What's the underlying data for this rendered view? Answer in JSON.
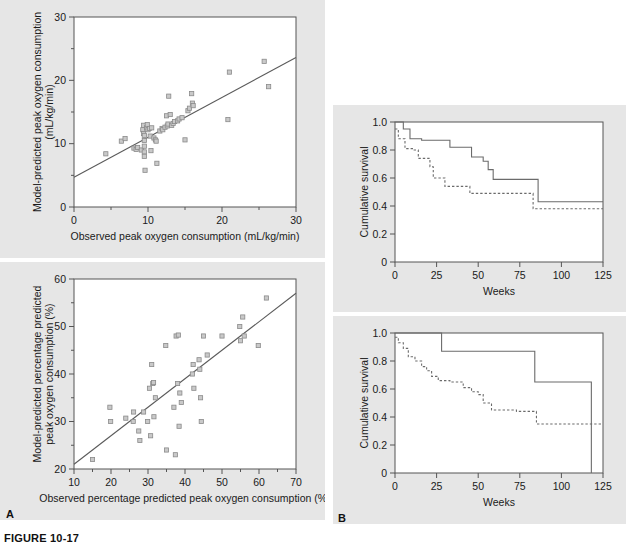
{
  "figure": {
    "caption": "FIGURE 10-17",
    "panel_a_label": "A",
    "panel_b_label": "B"
  },
  "chart_data": [
    {
      "id": "top-left",
      "type": "scatter",
      "title": "",
      "xlabel": "Observed peak oxygen consumption (mL/kg/min)",
      "ylabel": "Model-predicted peak oxygen consumption (mL/kg/min)",
      "ylabel_line1": "Model-predicted peak oxygen consumption",
      "ylabel_line2": "(mL/kg/min)",
      "xlim": [
        0,
        30
      ],
      "ylim": [
        0,
        30
      ],
      "xticks": [
        0,
        10,
        20,
        30
      ],
      "yticks": [
        0,
        10,
        20,
        30
      ],
      "xminor": [
        5,
        15,
        25
      ],
      "yminor": [
        5,
        15,
        25
      ],
      "grid": false,
      "legend": "none",
      "fit_line": {
        "x0": 0,
        "y0": 4.7,
        "x1": 30,
        "y1": 23.6
      },
      "points": [
        [
          4.3,
          8.4
        ],
        [
          6.4,
          10.4
        ],
        [
          6.9,
          10.8
        ],
        [
          8.1,
          9.3
        ],
        [
          8.4,
          9.1
        ],
        [
          8.6,
          9.4
        ],
        [
          9.1,
          9.0
        ],
        [
          9.3,
          12.2
        ],
        [
          9.4,
          12.9
        ],
        [
          9.4,
          11.6
        ],
        [
          9.5,
          11.3
        ],
        [
          9.5,
          10.5
        ],
        [
          9.5,
          9.6
        ],
        [
          9.5,
          8.7
        ],
        [
          9.5,
          8.0
        ],
        [
          9.6,
          5.8
        ],
        [
          9.8,
          12.5
        ],
        [
          9.9,
          13.0
        ],
        [
          10.0,
          12.2
        ],
        [
          10.2,
          12.4
        ],
        [
          10.3,
          11.2
        ],
        [
          10.4,
          8.9
        ],
        [
          10.5,
          12.5
        ],
        [
          10.8,
          10.9
        ],
        [
          11.0,
          10.6
        ],
        [
          11.1,
          10.4
        ],
        [
          11.2,
          6.9
        ],
        [
          11.6,
          12.0
        ],
        [
          11.9,
          12.4
        ],
        [
          12.0,
          12.2
        ],
        [
          12.3,
          12.6
        ],
        [
          12.5,
          14.4
        ],
        [
          12.6,
          12.8
        ],
        [
          12.7,
          13.1
        ],
        [
          12.8,
          17.5
        ],
        [
          13.0,
          14.6
        ],
        [
          13.2,
          12.9
        ],
        [
          13.4,
          13.2
        ],
        [
          13.6,
          13.5
        ],
        [
          14.0,
          13.6
        ],
        [
          14.2,
          13.9
        ],
        [
          14.6,
          14.1
        ],
        [
          15.0,
          10.6
        ],
        [
          15.4,
          15.2
        ],
        [
          15.6,
          15.6
        ],
        [
          15.9,
          17.9
        ],
        [
          16.0,
          16.4
        ],
        [
          16.1,
          16.0
        ],
        [
          20.8,
          13.8
        ],
        [
          21.0,
          21.3
        ],
        [
          25.7,
          23.0
        ],
        [
          26.3,
          19.0
        ]
      ]
    },
    {
      "id": "bottom-left",
      "type": "scatter",
      "title": "",
      "xlabel": "Observed percentage predicted peak oxygen consumption (%)",
      "ylabel": "Model-predicted percentage predicted peak oxygen consumption (%)",
      "ylabel_line1": "Model-predicted percentage predicted",
      "ylabel_line2": "peak oxygen consumption (%)",
      "xlim": [
        10,
        70
      ],
      "ylim": [
        20,
        60
      ],
      "xticks": [
        10,
        20,
        30,
        40,
        50,
        60,
        70
      ],
      "yticks": [
        20,
        30,
        40,
        50,
        60
      ],
      "xminor": [
        15,
        25,
        35,
        45,
        55,
        65
      ],
      "yminor": [
        25,
        35,
        45,
        55
      ],
      "grid": false,
      "legend": "none",
      "fit_line": {
        "x0": 10,
        "y0": 21.0,
        "x1": 70,
        "y1": 57.0
      },
      "points": [
        [
          15.0,
          22.0
        ],
        [
          19.7,
          33.0
        ],
        [
          19.9,
          30.0
        ],
        [
          24.0,
          30.7
        ],
        [
          26.0,
          30.0
        ],
        [
          26.1,
          32.0
        ],
        [
          27.5,
          28.0
        ],
        [
          27.8,
          26.0
        ],
        [
          28.8,
          32.0
        ],
        [
          29.9,
          30.0
        ],
        [
          30.4,
          37.0
        ],
        [
          30.7,
          27.0
        ],
        [
          31.0,
          42.0
        ],
        [
          31.3,
          38.0
        ],
        [
          31.5,
          38.2
        ],
        [
          31.6,
          31.0
        ],
        [
          32.0,
          35.0
        ],
        [
          34.8,
          46.0
        ],
        [
          35.0,
          24.0
        ],
        [
          37.0,
          33.0
        ],
        [
          37.4,
          23.0
        ],
        [
          37.6,
          48.0
        ],
        [
          38.0,
          38.0
        ],
        [
          38.2,
          48.2
        ],
        [
          38.4,
          29.0
        ],
        [
          38.6,
          36.0
        ],
        [
          39.0,
          34.0
        ],
        [
          42.0,
          40.0
        ],
        [
          42.2,
          42.0
        ],
        [
          42.4,
          37.0
        ],
        [
          43.8,
          43.0
        ],
        [
          44.0,
          41.0
        ],
        [
          44.2,
          35.0
        ],
        [
          44.4,
          30.0
        ],
        [
          45.0,
          48.0
        ],
        [
          46.0,
          44.0
        ],
        [
          50.0,
          48.0
        ],
        [
          54.8,
          50.0
        ],
        [
          55.0,
          47.0
        ],
        [
          55.6,
          52.0
        ],
        [
          56.0,
          48.0
        ],
        [
          59.8,
          46.0
        ],
        [
          62.0,
          56.0
        ]
      ]
    },
    {
      "id": "top-right",
      "type": "line",
      "subtype": "kaplan-meier",
      "title": "",
      "xlabel": "Weeks",
      "ylabel": "Cumulative survival",
      "xlim": [
        0,
        125
      ],
      "ylim": [
        0,
        1.0
      ],
      "xticks": [
        0,
        25,
        50,
        75,
        100,
        125
      ],
      "yticks": [
        0,
        0.2,
        0.4,
        0.6,
        0.8,
        1.0
      ],
      "ytick_labels": [
        "0",
        "0.2",
        "0.4",
        "0.6",
        "0.8",
        "1.0"
      ],
      "grid": false,
      "legend": "none",
      "series": [
        {
          "name": "solid",
          "style": "solid",
          "steps": [
            [
              0,
              1.0
            ],
            [
              5,
              1.0
            ],
            [
              5,
              0.95
            ],
            [
              9,
              0.95
            ],
            [
              9,
              0.88
            ],
            [
              16,
              0.88
            ],
            [
              16,
              0.87
            ],
            [
              33,
              0.87
            ],
            [
              33,
              0.82
            ],
            [
              46,
              0.82
            ],
            [
              46,
              0.75
            ],
            [
              53,
              0.75
            ],
            [
              53,
              0.72
            ],
            [
              56,
              0.72
            ],
            [
              56,
              0.66
            ],
            [
              59,
              0.66
            ],
            [
              59,
              0.59
            ],
            [
              86,
              0.59
            ],
            [
              86,
              0.43
            ],
            [
              125,
              0.43
            ]
          ]
        },
        {
          "name": "dashed",
          "style": "dashed",
          "steps": [
            [
              0,
              0.95
            ],
            [
              2,
              0.95
            ],
            [
              2,
              0.88
            ],
            [
              6,
              0.88
            ],
            [
              6,
              0.81
            ],
            [
              11,
              0.81
            ],
            [
              11,
              0.8
            ],
            [
              14,
              0.8
            ],
            [
              14,
              0.74
            ],
            [
              21,
              0.74
            ],
            [
              21,
              0.68
            ],
            [
              23,
              0.68
            ],
            [
              23,
              0.6
            ],
            [
              30,
              0.6
            ],
            [
              30,
              0.54
            ],
            [
              45,
              0.54
            ],
            [
              45,
              0.49
            ],
            [
              83,
              0.49
            ],
            [
              83,
              0.38
            ],
            [
              125,
              0.38
            ]
          ]
        }
      ]
    },
    {
      "id": "bottom-right",
      "type": "line",
      "subtype": "kaplan-meier",
      "title": "",
      "xlabel": "Weeks",
      "ylabel": "Cumulative survival",
      "xlim": [
        0,
        125
      ],
      "ylim": [
        0,
        1.0
      ],
      "xticks": [
        0,
        25,
        50,
        75,
        100,
        125
      ],
      "yticks": [
        0,
        0.2,
        0.4,
        0.6,
        0.8,
        1.0
      ],
      "ytick_labels": [
        "0",
        "0.2",
        "0.4",
        "0.6",
        "0.8",
        "1.0"
      ],
      "grid": false,
      "legend": "none",
      "series": [
        {
          "name": "solid",
          "style": "solid",
          "steps": [
            [
              0,
              1.0
            ],
            [
              28,
              1.0
            ],
            [
              28,
              0.87
            ],
            [
              84,
              0.87
            ],
            [
              84,
              0.65
            ],
            [
              118,
              0.65
            ],
            [
              118,
              0.0
            ]
          ]
        },
        {
          "name": "dashed",
          "style": "dashed",
          "steps": [
            [
              0,
              0.97
            ],
            [
              2,
              0.97
            ],
            [
              2,
              0.93
            ],
            [
              5,
              0.93
            ],
            [
              5,
              0.89
            ],
            [
              8,
              0.89
            ],
            [
              8,
              0.83
            ],
            [
              12,
              0.83
            ],
            [
              12,
              0.8
            ],
            [
              16,
              0.8
            ],
            [
              16,
              0.76
            ],
            [
              19,
              0.76
            ],
            [
              19,
              0.73
            ],
            [
              22,
              0.73
            ],
            [
              22,
              0.69
            ],
            [
              26,
              0.69
            ],
            [
              26,
              0.66
            ],
            [
              33,
              0.66
            ],
            [
              33,
              0.65
            ],
            [
              41,
              0.65
            ],
            [
              41,
              0.61
            ],
            [
              46,
              0.61
            ],
            [
              46,
              0.58
            ],
            [
              50,
              0.58
            ],
            [
              50,
              0.56
            ],
            [
              53,
              0.56
            ],
            [
              53,
              0.5
            ],
            [
              58,
              0.5
            ],
            [
              58,
              0.45
            ],
            [
              73,
              0.45
            ],
            [
              73,
              0.44
            ],
            [
              85,
              0.44
            ],
            [
              85,
              0.35
            ],
            [
              125,
              0.35
            ]
          ]
        }
      ]
    }
  ]
}
